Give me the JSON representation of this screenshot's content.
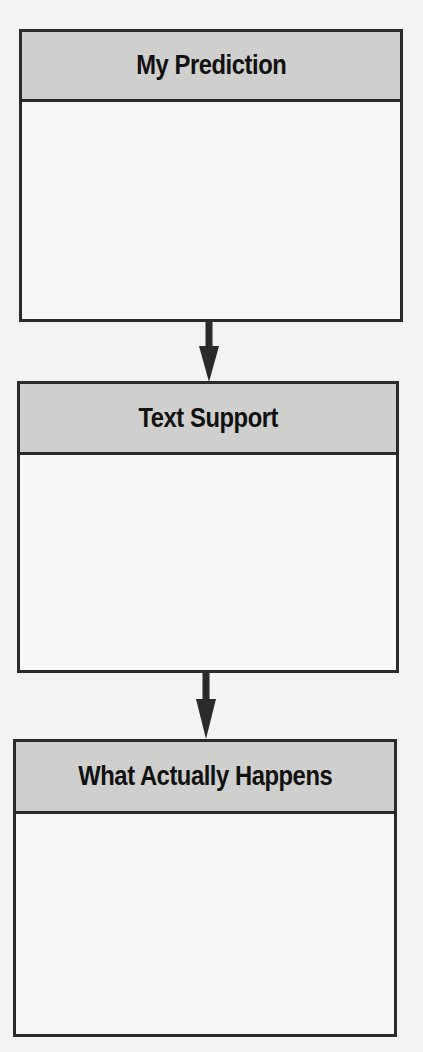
{
  "diagram": {
    "type": "flowchart",
    "direction": "top-to-bottom",
    "colors": {
      "background": "#f3f3f1",
      "header_fill": "#cfcfcd",
      "border": "#2a2a2a",
      "body_fill": "#f7f7f5",
      "arrow": "#2a2a2a"
    },
    "boxes": [
      {
        "title": "My Prediction",
        "body": ""
      },
      {
        "title": "Text Support",
        "body": ""
      },
      {
        "title": "What Actually Happens",
        "body": ""
      }
    ],
    "arrows": [
      {
        "from": "My Prediction",
        "to": "Text Support"
      },
      {
        "from": "Text Support",
        "to": "What Actually Happens"
      }
    ]
  }
}
